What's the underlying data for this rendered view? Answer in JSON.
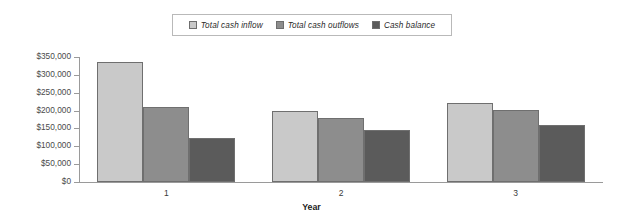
{
  "chart_data": {
    "type": "bar",
    "title": "",
    "xlabel": "Year",
    "ylabel": "",
    "categories": [
      "1",
      "2",
      "3"
    ],
    "series": [
      {
        "name": "Total cash inflow",
        "color": "#c9c9c9",
        "values": [
          336000,
          200000,
          222000
        ]
      },
      {
        "name": "Total cash outflows",
        "color": "#8d8d8d",
        "values": [
          211000,
          179000,
          203000
        ]
      },
      {
        "name": "Cash balance",
        "color": "#5b5b5b",
        "values": [
          123000,
          145000,
          161000
        ]
      }
    ],
    "ylim": [
      0,
      350000
    ],
    "ytick_values": [
      0,
      50000,
      100000,
      150000,
      200000,
      250000,
      300000,
      350000
    ],
    "ytick_labels": [
      "$0",
      "$50,000",
      "$100,000",
      "$150,000",
      "$200,000",
      "$250,000",
      "$300,000",
      "$350,000"
    ],
    "grid": false,
    "legend_position": "top-center",
    "legend_border_color": "#b9b9b9",
    "axis_color": "#9a9a9a",
    "bar_border_color": "#6f6f6f",
    "background_color": "#ffffff"
  },
  "legend": {
    "entries": [
      {
        "label": "Total cash inflow"
      },
      {
        "label": "Total cash outflows"
      },
      {
        "label": "Cash balance"
      }
    ]
  },
  "axes": {
    "x_title": "Year",
    "x_categories": [
      "1",
      "2",
      "3"
    ],
    "y_labels": [
      "$350,000",
      "$300,000",
      "$250,000",
      "$200,000",
      "$150,000",
      "$100,000",
      "$50,000",
      "$0"
    ]
  }
}
